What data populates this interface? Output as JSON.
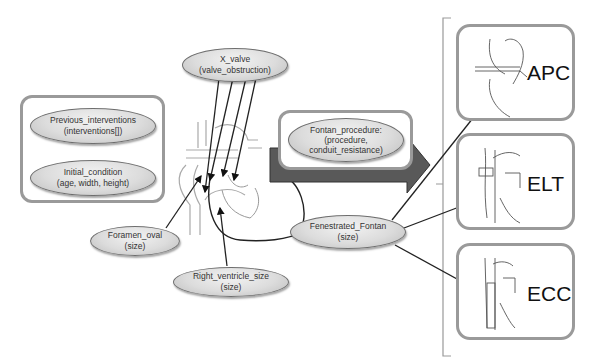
{
  "diagram": {
    "group_left": {
      "nodes": [
        {
          "title": "Previous_interventions",
          "params": "(interventions[])"
        },
        {
          "title": "Initial_condition",
          "params": "(age, width, height)"
        }
      ]
    },
    "x_valve": {
      "title": "X_valve",
      "params": "(valve_obstruction)"
    },
    "foramen_oval": {
      "title": "Foramen_oval",
      "params": "(size)"
    },
    "right_ventricle": {
      "title": "Right_ventricle_size",
      "params": "(size)"
    },
    "fontan_procedure": {
      "title": "Fontan_procedure:",
      "params1": "(procedure,",
      "params2": "conduit_resistance)"
    },
    "fenestrated_fontan": {
      "title": "Fenestrated_Fontan",
      "params": "(size)"
    },
    "options": [
      {
        "label": "APC",
        "icon": "heart-apc-icon"
      },
      {
        "label": "ELT",
        "icon": "heart-elt-icon"
      },
      {
        "label": "ECC",
        "icon": "heart-ecc-icon"
      }
    ],
    "colors": {
      "box_border": "#9a9a9a",
      "arrow_fill": "#595959",
      "node_fill": "#d9d9d9"
    }
  }
}
